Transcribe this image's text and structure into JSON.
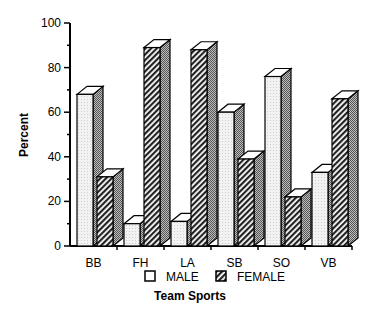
{
  "chart_data": {
    "type": "bar",
    "title": "",
    "xlabel": "Team Sports",
    "ylabel": "Percent",
    "ylim": [
      0,
      100
    ],
    "yticks": [
      0,
      20,
      40,
      60,
      80,
      100
    ],
    "grid": false,
    "legend_position": "bottom",
    "categories": [
      "BB",
      "FH",
      "LA",
      "SB",
      "SO",
      "VB"
    ],
    "series": [
      {
        "name": "MALE",
        "values": [
          68,
          10,
          11,
          60,
          76,
          33
        ],
        "pattern": "light-dotted"
      },
      {
        "name": "FEMALE",
        "values": [
          31,
          89,
          88,
          39,
          22,
          66
        ],
        "pattern": "diagonal-hatch"
      }
    ]
  }
}
